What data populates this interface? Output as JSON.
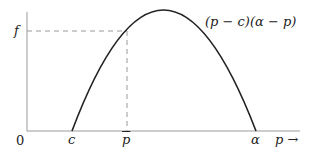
{
  "diagram": {
    "curve_label": "(p − c)(α − p)",
    "y_axis_label": "f",
    "x_axis_label": "p →",
    "origin_label": "0",
    "x_ticks": [
      {
        "label": "c"
      },
      {
        "label": "p"
      },
      {
        "label": "α"
      }
    ],
    "colors": {
      "axes": "#999999",
      "curve": "#222222",
      "dashed": "#999999",
      "text": "#222222"
    }
  }
}
